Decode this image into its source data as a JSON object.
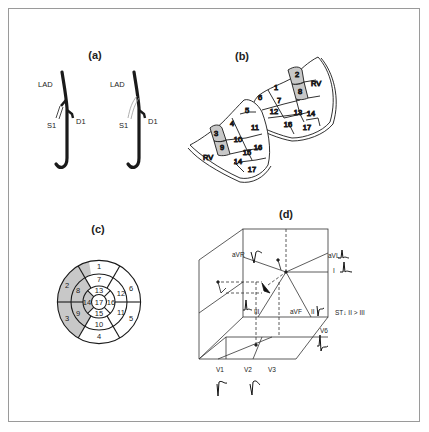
{
  "figure": {
    "panels": [
      {
        "id": "a",
        "label": "(a)",
        "title": "Coronary anatomy: LAD with first septal (S1) and first diagonal (D1) branches",
        "arteries": [
          {
            "name": "LAD",
            "label": "LAD",
            "branches": [
              "S1",
              "D1"
            ],
            "s1_occluded": true
          },
          {
            "name": "LAD",
            "label": "LAD",
            "branches": [
              "S1",
              "D1"
            ],
            "s1_occluded": false
          }
        ],
        "labels": {
          "lad": "LAD",
          "s1": "S1",
          "d1": "D1"
        }
      },
      {
        "id": "b",
        "label": "(b)",
        "title": "3D left ventricle 17-segment model",
        "labels": {
          "rv": "RV"
        },
        "segments_visible": [
          "1",
          "2",
          "3",
          "4",
          "5",
          "6",
          "7",
          "8",
          "9",
          "10",
          "11",
          "12",
          "13",
          "14",
          "15",
          "16",
          "17"
        ],
        "shaded_segments": [
          "2",
          "8",
          "3",
          "9"
        ]
      },
      {
        "id": "c",
        "label": "(c)",
        "title": "17-segment bullseye plot",
        "rings": {
          "basal": [
            "1",
            "2",
            "3",
            "4",
            "5",
            "6"
          ],
          "mid": [
            "7",
            "8",
            "9",
            "10",
            "11",
            "12"
          ],
          "apical": [
            "13",
            "14",
            "15",
            "16"
          ],
          "apex": [
            "17"
          ]
        },
        "shaded_segments": [
          "2",
          "3",
          "8",
          "9",
          "14"
        ]
      },
      {
        "id": "d",
        "label": "(d)",
        "title": "3D ECG lead vector cube",
        "limb_leads": {
          "avr": "aVR",
          "avl": "aVL",
          "i": "I",
          "iii": "III",
          "avf": "aVF",
          "ii": "II"
        },
        "precordial_leads": {
          "v1": "V1",
          "v2": "V2",
          "v3": "V3",
          "v6": "V6"
        },
        "annotation": "ST↓ II > III"
      }
    ]
  },
  "colors": {
    "frame": "#9a9a9a",
    "line": "#1a1a1a",
    "shade": "#c8c8c8",
    "text": "#222222"
  }
}
